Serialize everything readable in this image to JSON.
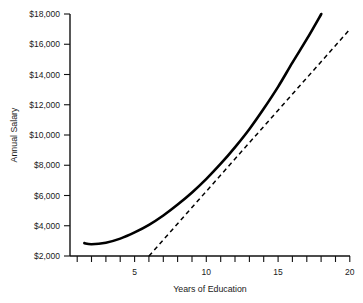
{
  "chart_data": {
    "type": "line",
    "title": "",
    "xlabel": "Years of Education",
    "ylabel": "Annual Salary",
    "xlim": [
      0.5,
      20
    ],
    "ylim": [
      2000,
      18000
    ],
    "grid": false,
    "legend": "none",
    "x_ticks_all": [
      1,
      2,
      3,
      4,
      5,
      6,
      7,
      8,
      9,
      10,
      11,
      12,
      13,
      14,
      15,
      16,
      17,
      18,
      19,
      20
    ],
    "x_tick_labels": [
      "5",
      "10",
      "15",
      "20"
    ],
    "x_tick_label_values": [
      5,
      10,
      15,
      20
    ],
    "y_tick_labels": [
      "$18,000",
      "$16,000",
      "$14,000",
      "$12,000",
      "$10,000",
      "$8,000",
      "$6,000",
      "$4,000",
      "$2,000"
    ],
    "y_tick_values": [
      18000,
      16000,
      14000,
      12000,
      10000,
      8000,
      6000,
      4000,
      2000
    ],
    "series": [
      {
        "name": "quadratic-fit",
        "style": "solid",
        "x": [
          1.5,
          2,
          3,
          4,
          5,
          6,
          7,
          8,
          9,
          10,
          11,
          12,
          13,
          14,
          15,
          16,
          17,
          18
        ],
        "values": [
          2850,
          2780,
          2880,
          3150,
          3560,
          4060,
          4680,
          5400,
          6200,
          7100,
          8100,
          9200,
          10400,
          11750,
          13200,
          14800,
          16350,
          18000
        ]
      },
      {
        "name": "linear-fit",
        "style": "dashed",
        "x": [
          6,
          20
        ],
        "values": [
          2000,
          17000
        ]
      }
    ]
  }
}
